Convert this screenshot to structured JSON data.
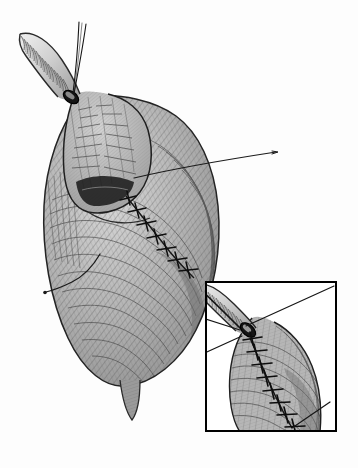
{
  "figure": {
    "kind": "surgical-line-illustration",
    "title": "Surgical anastomosis illustration",
    "technique": "pen-and-ink stipple and cross-hatch medical illustration",
    "background_color": "#fdfdfd",
    "ink_color": "#1a1a1a",
    "mid_tone_color": "#8d8d8d",
    "light_tone_color": "#c9c9c9",
    "shadow_color": "#2b2b2b",
    "canvas": {
      "width": 358,
      "height": 468
    },
    "has_text_labels": false,
    "label_text": ""
  },
  "main_view": {
    "name": "primary anatomical view",
    "organ_body": {
      "name": "stomach conduit body",
      "outline_color": "#2a2a2a",
      "fill_color": "#b4b4b4",
      "center_x": 120,
      "center_y": 245,
      "width": 170,
      "height": 290
    },
    "tube": {
      "name": "corrugated tubular structure",
      "description": "ribbed esophagus / bronchus segment entering at upper left",
      "ring_count": 26,
      "start_x": 22,
      "start_y": 38,
      "end_x": 72,
      "end_y": 95,
      "ring_color": "#6e6e6e",
      "outline_color": "#1f1f1f"
    },
    "lumen": {
      "name": "open lumen shadow",
      "color": "#1c1c1c",
      "center_x": 106,
      "center_y": 196
    },
    "suture_line": {
      "name": "interrupted suture row",
      "stitch_count": 7,
      "color": "#111111",
      "start_x": 128,
      "start_y": 198,
      "end_x": 196,
      "end_y": 270
    },
    "held_sutures": {
      "name": "traction suture threads",
      "count": 2,
      "color": "#151515",
      "apex_x": 74,
      "apex_y": 92
    },
    "leader_lines": [
      {
        "name": "leader-line-upper-right",
        "x1": 140,
        "y1": 172,
        "x2": 272,
        "y2": 152
      },
      {
        "name": "leader-line-lower-left",
        "x1": 96,
        "y1": 258,
        "x2": 44,
        "y2": 290
      }
    ],
    "apex": {
      "name": "distal apex taper",
      "x": 130,
      "y": 380
    }
  },
  "inset_view": {
    "name": "magnified detail inset",
    "border_color": "#000000",
    "border_width": 2,
    "x": 205,
    "y": 281,
    "width": 132,
    "height": 151,
    "contents": {
      "tube": {
        "name": "corrugated tubular structure detail",
        "ring_count": 16
      },
      "suture_line": {
        "name": "interrupted suture row detail",
        "stitch_count": 8
      },
      "leader_lines_count": 3
    }
  }
}
